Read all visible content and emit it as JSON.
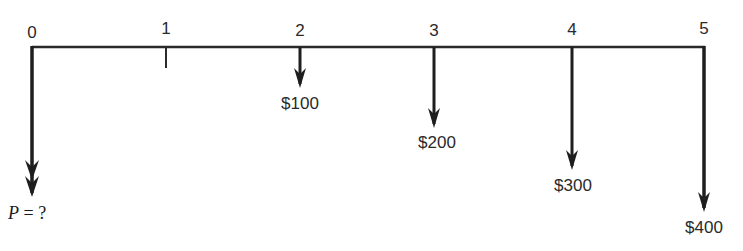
{
  "diagram": {
    "type": "cash-flow-timeline",
    "line_color": "#2a2a2a",
    "periods": [
      {
        "label": "0",
        "x": 32
      },
      {
        "label": "1",
        "x": 166
      },
      {
        "label": "2",
        "x": 300
      },
      {
        "label": "3",
        "x": 434
      },
      {
        "label": "4",
        "x": 572
      },
      {
        "label": "5",
        "x": 704
      }
    ],
    "cash_flows": [
      {
        "period": "2",
        "amount": "$100",
        "x": 300,
        "arrow_end_y": 88,
        "label_y": 95
      },
      {
        "period": "3",
        "amount": "$200",
        "x": 434,
        "arrow_end_y": 128,
        "label_y": 134
      },
      {
        "period": "4",
        "amount": "$300",
        "x": 572,
        "arrow_end_y": 170,
        "label_y": 177
      },
      {
        "period": "5",
        "amount": "$400",
        "x": 704,
        "arrow_end_y": 212,
        "label_y": 219
      }
    ],
    "present_value": {
      "symbol": "P",
      "equals": "=",
      "value": "?",
      "x": 32,
      "arrow_end_y": 195
    }
  }
}
